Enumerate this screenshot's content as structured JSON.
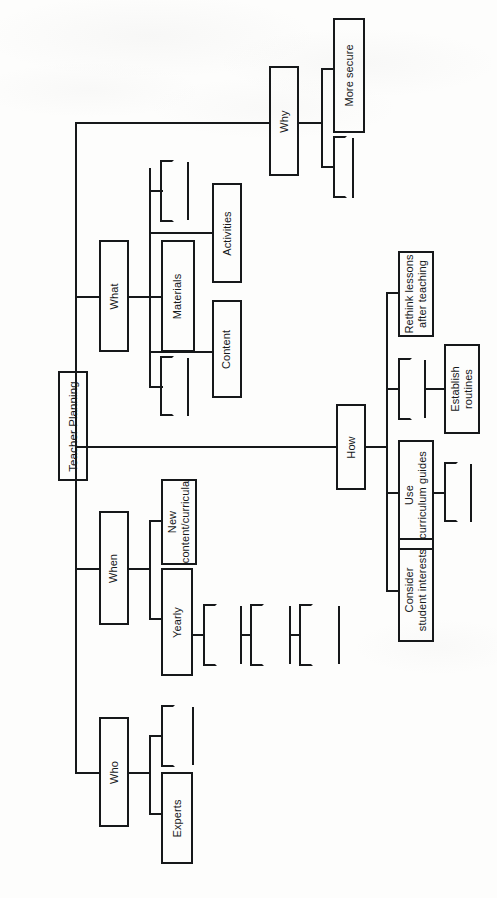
{
  "diagram": {
    "type": "mind-map-tree",
    "orientation": "rotated-90-left",
    "title": "Teacher Planning",
    "stroke_color": "#16181a",
    "background_color": "#fdfdfc",
    "root": {
      "label": "Teacher Planning"
    },
    "branches": [
      {
        "id": "why",
        "label": "Why",
        "children": [
          {
            "id": "why-more-secure",
            "label": "More secure"
          },
          {
            "id": "why-blank-1",
            "label": ""
          }
        ]
      },
      {
        "id": "what",
        "label": "What",
        "children": [
          {
            "id": "what-activities",
            "label": "Activities"
          },
          {
            "id": "what-materials",
            "label": "Materials"
          },
          {
            "id": "what-content",
            "label": "Content"
          },
          {
            "id": "what-blank-1",
            "label": ""
          },
          {
            "id": "what-blank-2",
            "label": ""
          }
        ]
      },
      {
        "id": "how",
        "label": "How",
        "children": [
          {
            "id": "how-rethink",
            "label": "Rethink lessons\nafter teaching"
          },
          {
            "id": "how-blank-1",
            "label": "",
            "children": [
              {
                "id": "how-establish",
                "label": "Establish\nroutines"
              }
            ]
          },
          {
            "id": "how-curriculum",
            "label": "Use\ncurriculum guides",
            "children": [
              {
                "id": "how-blank-2",
                "label": ""
              }
            ]
          },
          {
            "id": "how-consider",
            "label": "Consider\nstudent interests"
          }
        ]
      },
      {
        "id": "when",
        "label": "When",
        "children": [
          {
            "id": "when-new-content",
            "label": "New\ncontent/curricula"
          },
          {
            "id": "when-yearly",
            "label": "Yearly",
            "children": [
              {
                "id": "when-blank-1",
                "label": ""
              },
              {
                "id": "when-blank-2",
                "label": ""
              },
              {
                "id": "when-blank-3",
                "label": ""
              }
            ]
          }
        ]
      },
      {
        "id": "who",
        "label": "Who",
        "children": [
          {
            "id": "who-blank-1",
            "label": ""
          },
          {
            "id": "who-experts",
            "label": "Experts"
          }
        ]
      }
    ]
  }
}
